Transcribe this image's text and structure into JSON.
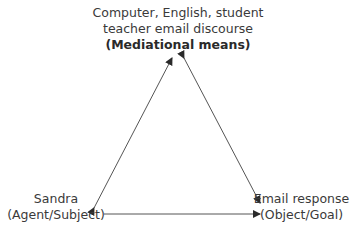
{
  "diagram": {
    "type": "triangle",
    "nodes": {
      "top": {
        "lines": [
          "Computer, English, student",
          "teacher email discourse"
        ],
        "label": "(Mediational means)"
      },
      "left": {
        "lines": [
          "Sandra",
          "(Agent/Subject)"
        ]
      },
      "right": {
        "lines": [
          "Email response",
          "(Object/Goal)"
        ]
      }
    },
    "edges": [
      {
        "from": "left",
        "to": "top",
        "bidirectional": true
      },
      {
        "from": "top",
        "to": "right",
        "bidirectional": true
      },
      {
        "from": "left",
        "to": "right",
        "bidirectional": false
      }
    ],
    "colors": {
      "line": "#3a3a3a",
      "text": "#3a3a3a"
    }
  }
}
